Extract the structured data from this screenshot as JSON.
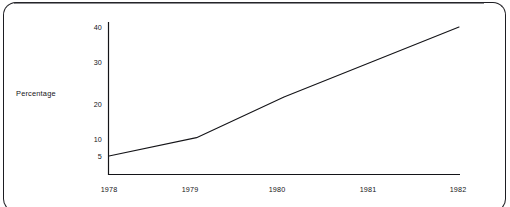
{
  "figure": {
    "background_color": "#ffffff",
    "frame_color": "#1d1d22",
    "ink_color": "#141418"
  },
  "chart_data": {
    "type": "line",
    "title": "",
    "subtitle": "",
    "xlabel": "",
    "ylabel": "Percentage",
    "x": [
      "1978",
      "1979",
      "1980",
      "1981",
      "1982"
    ],
    "categories": [
      "1978",
      "1979",
      "1980",
      "1981",
      "1982"
    ],
    "values": [
      5,
      10,
      21,
      30.5,
      40
    ],
    "series": [
      {
        "name": "Percentage",
        "values": [
          5,
          10,
          21,
          30.5,
          40
        ],
        "color": "#141418"
      }
    ],
    "xlim": [
      "1978",
      "1982"
    ],
    "ylim": [
      0,
      43
    ],
    "y_ticks": [
      5,
      10,
      20,
      30,
      40
    ],
    "y_tick_labels": [
      "5",
      "10",
      "20",
      "30",
      "40"
    ],
    "x_ticks": [
      "1978",
      "1979",
      "1980",
      "1981",
      "1982"
    ],
    "x_tick_labels": [
      "1978",
      "1979",
      "1980",
      "1981",
      "1982"
    ],
    "grid": false,
    "legend": false,
    "legend_position": "none",
    "markers": false,
    "line_width": 1.1,
    "annotations": []
  },
  "axes": {
    "y_axis": {
      "label": "Percentage",
      "ticks": [
        {
          "value": 40,
          "label": "40"
        },
        {
          "value": 30,
          "label": "30"
        },
        {
          "value": 20,
          "label": "20"
        },
        {
          "value": 10,
          "label": "10"
        },
        {
          "value": 5,
          "label": "5"
        }
      ]
    },
    "x_axis": {
      "label": "",
      "ticks": [
        {
          "value": "1978",
          "label": "1978"
        },
        {
          "value": "1979",
          "label": "1979"
        },
        {
          "value": "1980",
          "label": "1980"
        },
        {
          "value": "1981",
          "label": "1981"
        },
        {
          "value": "1982",
          "label": "1982"
        }
      ]
    }
  }
}
